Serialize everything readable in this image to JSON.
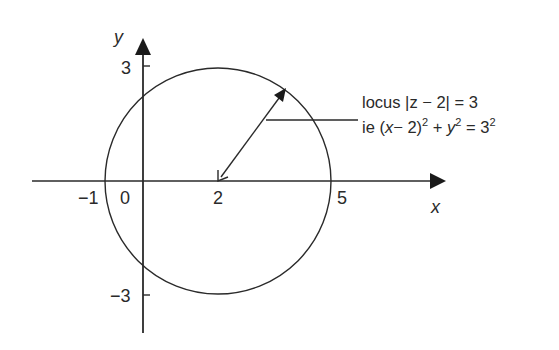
{
  "diagram": {
    "type": "argand-locus",
    "axes": {
      "x_label": "x",
      "y_label": "y",
      "x_ticks": [
        {
          "value": -1,
          "label": "−1"
        },
        {
          "value": 0,
          "label": "0"
        },
        {
          "value": 2,
          "label": "2"
        },
        {
          "value": 5,
          "label": "5"
        }
      ],
      "y_ticks": [
        {
          "value": 3,
          "label": "3"
        },
        {
          "value": -3,
          "label": "−3"
        }
      ]
    },
    "circle": {
      "center": [
        2,
        0
      ],
      "radius": 3
    },
    "radius_arrow": {
      "from": [
        2,
        0
      ],
      "direction": "upper-right",
      "double_headed": true
    },
    "annotation": {
      "line1": "locus |z − 2| = 3",
      "line2_prefix": "ie (",
      "line2_x": "x",
      "line2_mid": "− 2)",
      "line2_sup1": "2",
      "line2_plus": " + ",
      "line2_y": "y",
      "line2_sup2": "2",
      "line2_eq": " = 3",
      "line2_sup3": "2"
    },
    "colors": {
      "stroke": "#2a2a2a",
      "background": "#ffffff"
    }
  }
}
